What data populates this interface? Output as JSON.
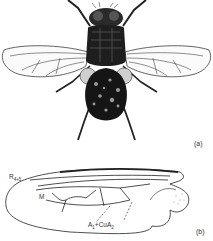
{
  "figure": {
    "panels": [
      {
        "id": "a",
        "label": "(a)",
        "content": "Dorsal view of adult fly (Diptera)"
      },
      {
        "id": "b",
        "label": "(b)",
        "content": "Wing venation diagram"
      }
    ],
    "wing_labels": {
      "r45_main": "R",
      "r45_sub": "4+5",
      "m": "M",
      "a1_main": "A",
      "a1_sub": "1",
      "plus_cua": "+CuA",
      "cua_sub": "2"
    },
    "colors": {
      "background": "#ffffff",
      "ink": "#111111",
      "label": "#333333"
    }
  }
}
